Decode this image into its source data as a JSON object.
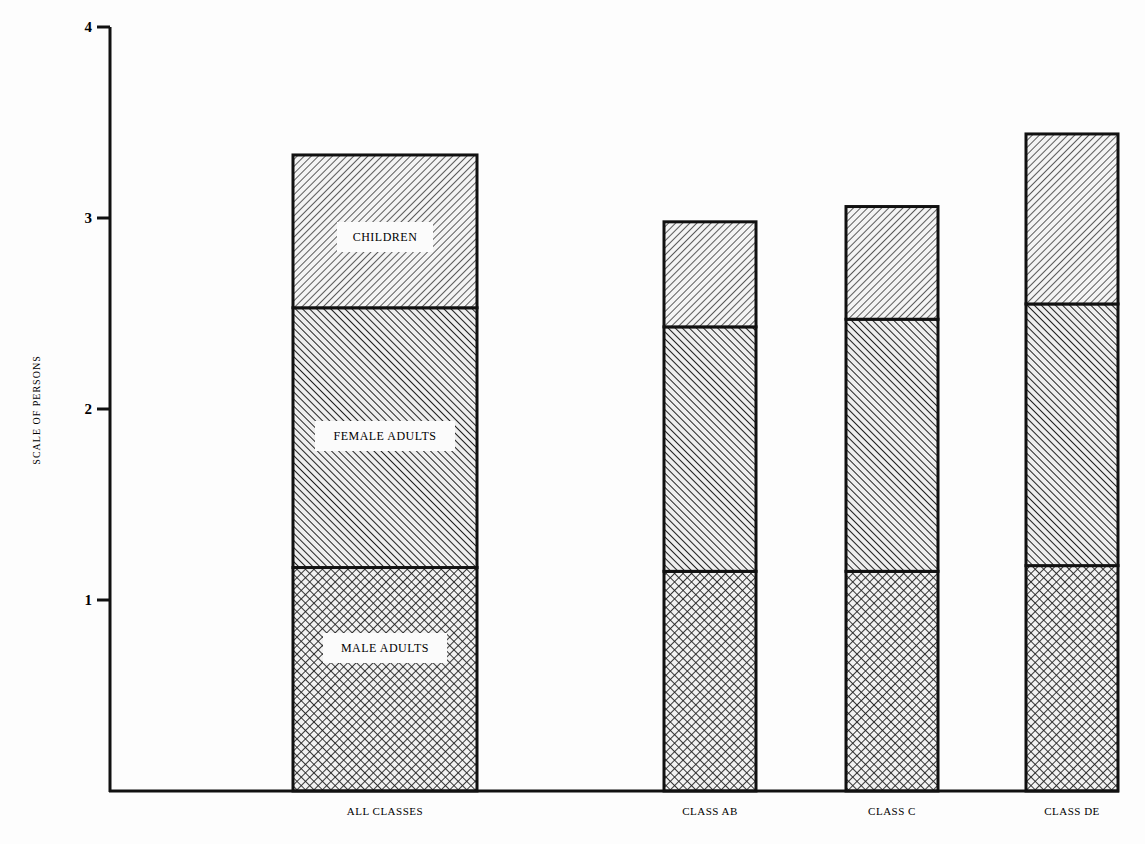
{
  "chart_data": {
    "type": "bar",
    "stacked": true,
    "title": "",
    "xlabel": "",
    "ylabel": "SCALE OF PERSONS",
    "ylim": [
      0,
      4
    ],
    "yticks": [
      1,
      2,
      3,
      4
    ],
    "grid": false,
    "legend_position": "inline labels on first bar",
    "categories": [
      "ALL CLASSES",
      "CLASS AB",
      "CLASS C",
      "CLASS DE"
    ],
    "series": [
      {
        "name": "MALE ADULTS",
        "pattern": "crosshatch",
        "values": [
          1.17,
          1.15,
          1.15,
          1.18
        ]
      },
      {
        "name": "FEMALE ADULTS",
        "pattern": "backslash",
        "values": [
          1.36,
          1.28,
          1.32,
          1.37
        ]
      },
      {
        "name": "CHILDREN",
        "pattern": "slash",
        "values": [
          0.8,
          0.55,
          0.59,
          0.89
        ]
      }
    ],
    "totals": [
      3.33,
      2.98,
      3.06,
      3.44
    ]
  },
  "axis": {
    "ylabel": "SCALE OF PERSONS",
    "ticks": [
      "1",
      "2",
      "3",
      "4"
    ]
  },
  "segment_labels": {
    "children": "CHILDREN",
    "female": "FEMALE ADULTS",
    "male": "MALE ADULTS"
  },
  "colors": {
    "ink": "#111111",
    "paper": "#fdfdfd"
  }
}
